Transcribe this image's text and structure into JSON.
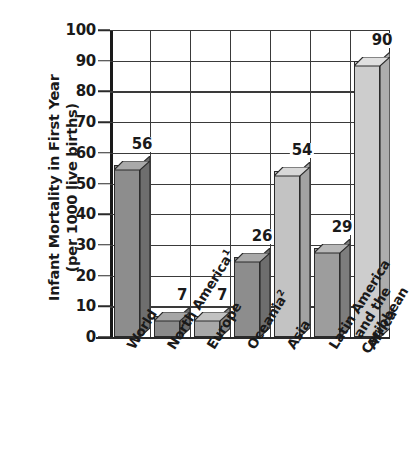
{
  "chart_data": {
    "type": "bar",
    "title": "",
    "xlabel": "",
    "ylabel": "Infant Mortality in First Year\n(per 1000 live births)",
    "ylim": [
      0,
      100
    ],
    "yticks": [
      0,
      10,
      20,
      30,
      40,
      50,
      60,
      70,
      80,
      90,
      100
    ],
    "ytick_labels": [
      "0",
      "10",
      "20",
      "30",
      "40",
      "50",
      "60",
      "70",
      "80",
      "90",
      "100"
    ],
    "grid": "both",
    "legend": "none",
    "style": "3d-bar",
    "categories": [
      "World",
      "North America¹",
      "Europe",
      "Oceania²",
      "Asia",
      "Latin America and the Caribbean",
      "Africa"
    ],
    "values": [
      56,
      7,
      7,
      26,
      54,
      29,
      90
    ],
    "value_labels": [
      "56",
      "7",
      "7",
      "26",
      "54",
      "29",
      "90"
    ],
    "bars": [
      {
        "category": "World",
        "label_lines": [
          "World"
        ],
        "footnote_marker": "",
        "value": 56,
        "value_label": "56",
        "front_color": "#8d8d8d",
        "top_color": "#a9a9a9",
        "side_color": "#6e6e6e"
      },
      {
        "category": "North America",
        "label_lines": [
          "North America"
        ],
        "footnote_marker": "1",
        "value": 7,
        "value_label": "7",
        "front_color": "#8a8a8a",
        "top_color": "#a6a6a6",
        "side_color": "#6b6b6b"
      },
      {
        "category": "Europe",
        "label_lines": [
          "Europe"
        ],
        "footnote_marker": "",
        "value": 7,
        "value_label": "7",
        "front_color": "#a8a8a8",
        "top_color": "#c2c2c2",
        "side_color": "#878787"
      },
      {
        "category": "Oceania",
        "label_lines": [
          "Oceania"
        ],
        "footnote_marker": "2",
        "value": 26,
        "value_label": "26",
        "front_color": "#8d8d8d",
        "top_color": "#a9a9a9",
        "side_color": "#6e6e6e"
      },
      {
        "category": "Asia",
        "label_lines": [
          "Asia"
        ],
        "footnote_marker": "",
        "value": 54,
        "value_label": "54",
        "front_color": "#c3c3c3",
        "top_color": "#d8d8d8",
        "side_color": "#a3a3a3"
      },
      {
        "category": "Latin America and the Caribbean",
        "label_lines": [
          "Latin America",
          "and the",
          "Caribbean"
        ],
        "footnote_marker": "",
        "value": 29,
        "value_label": "29",
        "front_color": "#9d9d9d",
        "top_color": "#b8b8b8",
        "side_color": "#7d7d7d"
      },
      {
        "category": "Africa",
        "label_lines": [
          "Africa"
        ],
        "footnote_marker": "",
        "value": 90,
        "value_label": "90",
        "front_color": "#cdcdcd",
        "top_color": "#e0e0e0",
        "side_color": "#adadad"
      }
    ],
    "colors": {
      "axis": "#2a2a2a",
      "grid": "#3a3a3a",
      "text": "#1a1a1a",
      "background": "#ffffff"
    }
  }
}
